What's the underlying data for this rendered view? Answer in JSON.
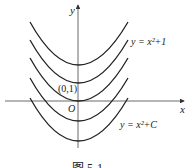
{
  "figure": {
    "caption": "图 5-1",
    "axes": {
      "x_label": "x",
      "y_label": "y",
      "origin_label": "O"
    },
    "point_label": "(0,1)",
    "curve_labels": {
      "top": "y = x²+1",
      "bottom": "y = x²+C"
    },
    "family": "y = x² + C",
    "curve_vertex_offsets": [
      2,
      1,
      0,
      -1,
      -2
    ]
  }
}
